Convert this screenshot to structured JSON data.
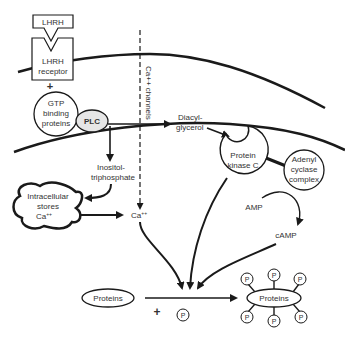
{
  "diagram": {
    "ligand": {
      "label": "LHRH"
    },
    "receptor": {
      "line1": "LHRH",
      "line2": "receptor"
    },
    "plus_top": "+",
    "gtp": {
      "line1": "GTP",
      "line2": "binding",
      "line3": "proteins"
    },
    "plc": {
      "label": "PLC"
    },
    "ca_channels": {
      "label": "Ca++ channels"
    },
    "dag": {
      "line1": "Diacyl-",
      "line2": "glycerol"
    },
    "ip3": {
      "line1": "Inositol-",
      "line2": "triphosphate"
    },
    "stores": {
      "line1": "Intracellular",
      "line2": "stores",
      "line3": "Ca",
      "sup": "++"
    },
    "ca": {
      "label": "Ca",
      "sup": "++"
    },
    "pkc": {
      "line1": "Protein",
      "line2": "kinase C"
    },
    "adenyl": {
      "line1": "Adenyl",
      "line2": "cyclase",
      "line3": "complex"
    },
    "amp": {
      "label": "AMP"
    },
    "camp": {
      "label": "cAMP"
    },
    "proteins_in": {
      "label": "Proteins"
    },
    "plus_bottom": "+",
    "phosphate": {
      "label": "P"
    },
    "proteins_out": {
      "label": "Proteins"
    },
    "colors": {
      "stroke": "#1a1a1a",
      "text": "#333333",
      "plc_fill": "#e6e6e6"
    }
  }
}
